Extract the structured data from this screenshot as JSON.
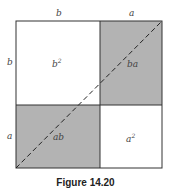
{
  "figure": {
    "caption": "Figure 14.20",
    "colors": {
      "shade": "#b3b3b3",
      "line": "#333333",
      "background": "#ffffff"
    },
    "top_labels": {
      "left": "b",
      "right": "a"
    },
    "side_labels": {
      "top": "b",
      "bottom": "a"
    },
    "regions": {
      "top_left": {
        "label": "b",
        "exp": "2",
        "shaded": false
      },
      "top_right": {
        "label": "ba",
        "shaded": true
      },
      "bottom_left": {
        "label": "ab",
        "shaded": true
      },
      "bottom_right": {
        "label": "a",
        "exp": "2",
        "shaded": false
      }
    },
    "diagonal": "dashed line from bottom-left to top-right corner"
  }
}
